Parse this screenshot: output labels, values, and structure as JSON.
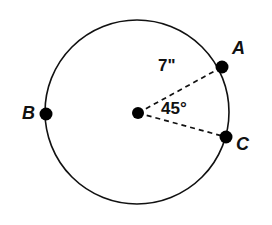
{
  "figure": {
    "background_color": "#ffffff",
    "stroke_color": "#111111",
    "point_color": "#000000",
    "circle": {
      "center_x": 137,
      "center_y": 112,
      "radius_px": 92,
      "radius_value": "7\"",
      "stroke_width": 1.6
    },
    "center_point": {
      "name": "center",
      "x": 138,
      "y": 113,
      "dot_radius": 6
    },
    "points": [
      {
        "label": "A",
        "x": 222,
        "y": 67,
        "dot_radius": 6.5
      },
      {
        "label": "B",
        "x": 46,
        "y": 114,
        "dot_radius": 6.5
      },
      {
        "label": "C",
        "x": 226,
        "y": 137,
        "dot_radius": 6.5
      }
    ],
    "radii": [
      {
        "name": "radius-to-a",
        "from": "center",
        "to": "A",
        "style": "dashed"
      },
      {
        "name": "radius-to-c",
        "from": "center",
        "to": "C",
        "style": "dashed"
      }
    ],
    "annotations": {
      "radius_measure": "7\"",
      "central_angle": "45°"
    },
    "dash_pattern": "5,4"
  },
  "chart_data": {
    "type": "diagram",
    "shape": "circle",
    "radius": 7,
    "radius_unit": "inches",
    "radius_label": "7\"",
    "central_angle_degrees": 45,
    "central_angle_label": "45°",
    "labeled_points": [
      "A",
      "B",
      "C"
    ],
    "angle_vertex": "center",
    "angle_rays": [
      "A",
      "C"
    ]
  }
}
